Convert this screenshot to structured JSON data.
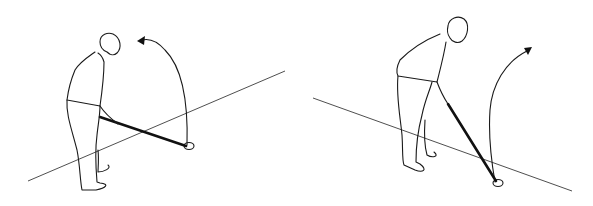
{
  "figure": {
    "background": "#ffffff",
    "stroke_color": "#1a1a1a",
    "panels": [
      {
        "id": "left",
        "label": "",
        "golfer_orientation": "facing right toward ball, club extended along target line",
        "ground_line": {
          "x1": 28,
          "y1": 181,
          "x2": 285,
          "y2": 71
        },
        "swing_arrow": "arc up from ball over golfer's head, pointing back left"
      },
      {
        "id": "right",
        "label": "",
        "golfer_orientation": "facing ball, club angled downward toward viewer",
        "ground_line": {
          "x1": 313,
          "y1": 98,
          "x2": 572,
          "y2": 191
        },
        "swing_arrow": "arc up from ball, pointing up and right"
      }
    ]
  }
}
